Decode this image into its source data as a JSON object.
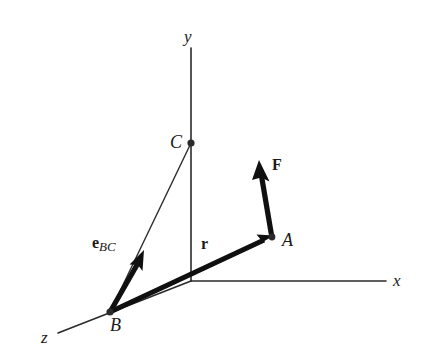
{
  "figure": {
    "background_color": "#ffffff",
    "line_color": "#1a1a1a",
    "axes": {
      "y_label": "y",
      "x_label": "x",
      "z_label": "z",
      "origin": {
        "x": 191,
        "y": 281
      },
      "y_tip": {
        "x": 191,
        "y": 48
      },
      "x_tip": {
        "x": 386,
        "y": 281
      },
      "z_tip": {
        "x": 58,
        "y": 333
      }
    },
    "points": [
      {
        "name": "C",
        "label": "C",
        "x": 191,
        "y": 143,
        "dot": true
      },
      {
        "name": "B",
        "label": "B",
        "x": 110,
        "y": 312,
        "dot": true
      },
      {
        "name": "A",
        "label": "A",
        "x": 272,
        "y": 237,
        "dot": true
      }
    ],
    "vectors": [
      {
        "name": "r",
        "label": "r",
        "bold": true,
        "from": {
          "x": 110,
          "y": 312
        },
        "to": {
          "x": 273,
          "y": 236
        },
        "style": "thick-arrow"
      },
      {
        "name": "F",
        "label": "F",
        "bold": true,
        "from": {
          "x": 272,
          "y": 237
        },
        "to": {
          "x": 259,
          "y": 161
        },
        "style": "thick-arrow"
      },
      {
        "name": "e_BC",
        "label": "e",
        "subscript": "BC",
        "bold": true,
        "from": {
          "x": 110,
          "y": 312
        },
        "to": {
          "x": 143,
          "y": 251
        },
        "style": "thick-arrow"
      }
    ],
    "construction_lines": [
      {
        "name": "line-B-to-C",
        "from": {
          "x": 110,
          "y": 312
        },
        "to": {
          "x": 191,
          "y": 143
        },
        "style": "thin"
      }
    ]
  }
}
